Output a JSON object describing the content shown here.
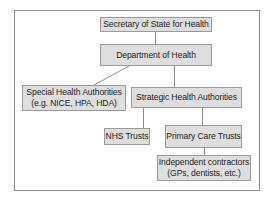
{
  "diagram": {
    "type": "org-chart",
    "nodes": [
      {
        "id": "sec",
        "lines": [
          "Secretary of State for Health"
        ]
      },
      {
        "id": "doh",
        "lines": [
          "Department of Health"
        ]
      },
      {
        "id": "sha",
        "lines": [
          "Special Health Authorities",
          "(e.g. NICE, HPA, HDA)"
        ]
      },
      {
        "id": "stha",
        "lines": [
          "Strategic Health Authorities"
        ]
      },
      {
        "id": "nhs",
        "lines": [
          "NHS Trusts"
        ]
      },
      {
        "id": "pct",
        "lines": [
          "Primary Care Trusts"
        ]
      },
      {
        "id": "ind",
        "lines": [
          "Independent contractors",
          "(GPs, dentists, etc.)"
        ]
      }
    ],
    "edges": [
      {
        "from": "sec",
        "to": "doh"
      },
      {
        "from": "doh",
        "to": "sha"
      },
      {
        "from": "doh",
        "to": "stha"
      },
      {
        "from": "stha",
        "to": "nhs"
      },
      {
        "from": "stha",
        "to": "pct"
      },
      {
        "from": "pct",
        "to": "ind"
      }
    ]
  },
  "colors": {
    "box_fill": "#dedede",
    "box_border": "#9a9a9a",
    "connector": "#8c8c8c",
    "frame_border": "#8a8a8a",
    "text": "#1e1e1e"
  }
}
